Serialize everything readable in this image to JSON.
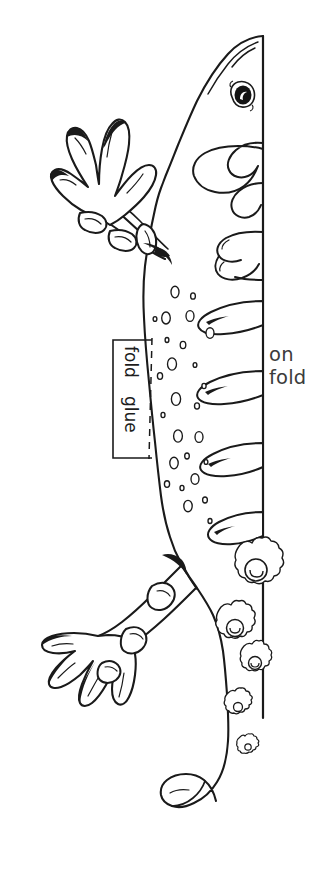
{
  "document": {
    "kind": "dinosaur-fold-craft-template",
    "background_color": "#ffffff",
    "ink_color": "#1a1a1a",
    "width": 314,
    "height": 873
  },
  "labels": {
    "on_fold": "on\nfold",
    "fold": "fold",
    "glue": "glue"
  },
  "artwork": {
    "subject": "spiked dinosaur side profile",
    "line_color": "#1a1a1a",
    "fill_color": "#ffffff",
    "fold_line": {
      "name": "vertical-fold-line",
      "x": 263,
      "y_top": 36,
      "y_bottom": 718
    },
    "glue_tab": {
      "x": 113,
      "y": 340,
      "width": 40,
      "height": 118,
      "dashed_edge": "right"
    }
  }
}
